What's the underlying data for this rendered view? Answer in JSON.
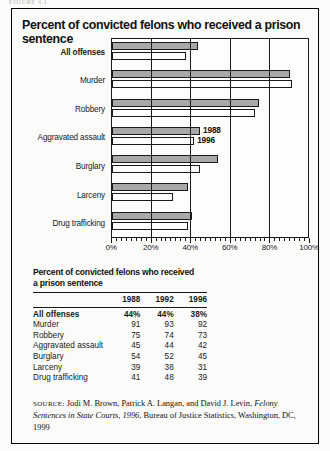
{
  "figure_tag": "FIGURE 4.1",
  "chart_panel": {
    "title": "Percent of convicted felons who received a prison sentence"
  },
  "chart_data": {
    "type": "bar",
    "orientation": "horizontal",
    "title": "Percent of convicted felons who received a prison sentence",
    "xlabel": "",
    "ylabel": "",
    "xlim": [
      0,
      100
    ],
    "xticks": [
      "0%",
      "20%",
      "40%",
      "60%",
      "80%",
      "100%"
    ],
    "xtick_values": [
      0,
      20,
      40,
      60,
      80,
      100
    ],
    "grid": true,
    "grid_axis": "x",
    "legend_position": "inline-at-aggravated-assault",
    "categories": [
      "All offenses",
      "Murder",
      "Robbery",
      "Aggravated assault",
      "Burglary",
      "Larceny",
      "Drug trafficking"
    ],
    "series": [
      {
        "name": "1988",
        "color": "#a8a8a8",
        "values": [
          44,
          91,
          75,
          45,
          54,
          39,
          41
        ]
      },
      {
        "name": "1996",
        "color": "#ffffff",
        "values": [
          38,
          92,
          73,
          42,
          45,
          31,
          39
        ]
      }
    ],
    "legend_labels": [
      "1988",
      "1996"
    ]
  },
  "table": {
    "title_line1": "Percent of convicted felons who received",
    "title_line2": "a prison sentence",
    "columns": [
      "",
      "1988",
      "1992",
      "1996"
    ],
    "rows": [
      {
        "label": "All offenses",
        "v1988": "44%",
        "v1992": "44%",
        "v1996": "38%"
      },
      {
        "label": "Murder",
        "v1988": "91",
        "v1992": "93",
        "v1996": "92"
      },
      {
        "label": "Robbery",
        "v1988": "75",
        "v1992": "74",
        "v1996": "73"
      },
      {
        "label": "Aggravated assault",
        "v1988": "45",
        "v1992": "44",
        "v1996": "42"
      },
      {
        "label": "Burglary",
        "v1988": "54",
        "v1992": "52",
        "v1996": "45"
      },
      {
        "label": "Larceny",
        "v1988": "39",
        "v1992": "38",
        "v1996": "31"
      },
      {
        "label": "Drug trafficking",
        "v1988": "41",
        "v1992": "48",
        "v1996": "39"
      }
    ]
  },
  "source": {
    "label": "SOURCE:",
    "authors": " Jodi M. Brown, Patrick A. Langan, and David J. Levin, ",
    "publication": "Felony Sentences in State Courts, 1996",
    "rest": ", Bureau of Justice Statistics, Washington, DC, 1999"
  }
}
